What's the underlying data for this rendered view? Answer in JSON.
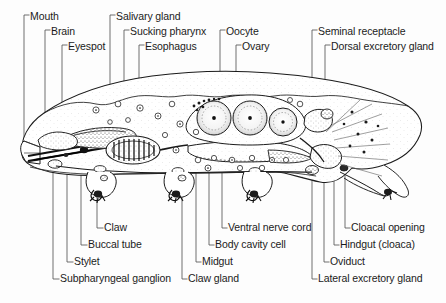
{
  "figure": {
    "orientation": "lateral-view-head-left",
    "background_color": "#fdfdfd",
    "ink_color": "#1b1b1b",
    "leader_color": "#555555"
  },
  "labels_top": [
    {
      "text": "Mouth",
      "text_x": 30,
      "text_y": 11,
      "elbow_x": 24,
      "line_x": 24,
      "line_y2": 158
    },
    {
      "text": "Brain",
      "text_x": 51,
      "text_y": 26,
      "elbow_x": 45,
      "line_x": 45,
      "line_y2": 142
    },
    {
      "text": "Eyespot",
      "text_x": 68,
      "text_y": 41,
      "elbow_x": 62,
      "line_x": 62,
      "line_y2": 137
    },
    {
      "text": "Salivary gland",
      "text_x": 116,
      "text_y": 11,
      "elbow_x": 110,
      "line_x": 110,
      "line_y2": 130
    },
    {
      "text": "Sucking pharynx",
      "text_x": 130,
      "text_y": 26,
      "elbow_x": 124,
      "line_x": 124,
      "line_y2": 134
    },
    {
      "text": "Esophagus",
      "text_x": 145,
      "text_y": 41,
      "elbow_x": 139,
      "line_x": 139,
      "line_y2": 128
    },
    {
      "text": "Oocyte",
      "text_x": 226,
      "text_y": 26,
      "elbow_x": 220,
      "line_x": 220,
      "line_y2": 96
    },
    {
      "text": "Ovary",
      "text_x": 242,
      "text_y": 41,
      "elbow_x": 236,
      "line_x": 236,
      "line_y2": 99
    },
    {
      "text": "Seminal receptacle",
      "text_x": 318,
      "text_y": 26,
      "elbow_x": 312,
      "line_x": 312,
      "line_y2": 118
    },
    {
      "text": "Dorsal excretory gland",
      "text_x": 331,
      "text_y": 41,
      "elbow_x": 325,
      "line_x": 325,
      "line_y2": 116
    }
  ],
  "labels_bottom": [
    {
      "text": "Claw",
      "text_x": 104,
      "text_y": 222,
      "elbow_x": 97,
      "line_x": 97,
      "line_y1": 168
    },
    {
      "text": "Buccal tube",
      "text_x": 88,
      "text_y": 239,
      "elbow_x": 81,
      "line_x": 81,
      "line_y1": 158
    },
    {
      "text": "Stylet",
      "text_x": 74,
      "text_y": 256,
      "elbow_x": 67,
      "line_x": 67,
      "line_y1": 160
    },
    {
      "text": "Subpharyngeal ganglion",
      "text_x": 60,
      "text_y": 273,
      "elbow_x": 53,
      "line_x": 53,
      "line_y1": 164
    },
    {
      "text": "Ventral nerve cord",
      "text_x": 228,
      "text_y": 222,
      "elbow_x": 222,
      "line_x": 222,
      "line_y1": 170
    },
    {
      "text": "Body cavity cell",
      "text_x": 215,
      "text_y": 239,
      "elbow_x": 209,
      "line_x": 209,
      "line_y1": 168
    },
    {
      "text": "Midgut",
      "text_x": 202,
      "text_y": 256,
      "elbow_x": 196,
      "line_x": 196,
      "line_y1": 160
    },
    {
      "text": "Claw gland",
      "text_x": 188,
      "text_y": 273,
      "elbow_x": 182,
      "line_x": 182,
      "line_y1": 172
    },
    {
      "text": "Cloacal opening",
      "text_x": 351,
      "text_y": 222,
      "elbow_x": 345,
      "line_x": 345,
      "line_y1": 170
    },
    {
      "text": "Hindgut (cloaca)",
      "text_x": 340,
      "text_y": 239,
      "elbow_x": 334,
      "line_x": 334,
      "line_y1": 168
    },
    {
      "text": "Oviduct",
      "text_x": 330,
      "text_y": 256,
      "elbow_x": 324,
      "line_x": 324,
      "line_y1": 166
    },
    {
      "text": "Lateral excretory gland",
      "text_x": 318,
      "text_y": 273,
      "elbow_x": 312,
      "line_x": 312,
      "line_y1": 170
    }
  ]
}
